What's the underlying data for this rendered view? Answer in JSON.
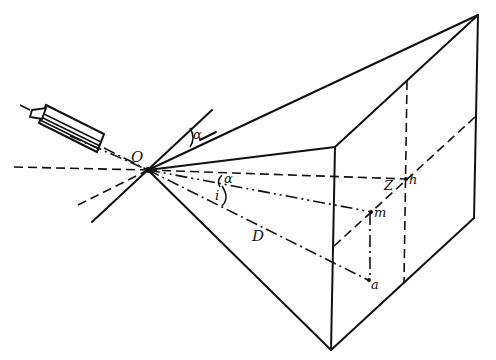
{
  "diagram": {
    "type": "geometric-optics-perspective",
    "colors": {
      "ink": "#111111",
      "background": "#ffffff"
    },
    "labels": {
      "origin": "O",
      "angle_upper": "α",
      "angle_lower": "α",
      "angle_i": "i",
      "distance": "D",
      "point_h": "h",
      "point_m": "m",
      "point_a": "a",
      "marker_z": "Z"
    },
    "elements": [
      "light-source-cylinder",
      "reflecting-plane-lines",
      "pyramid-to-rectangular-screen",
      "horizontal-reference-line",
      "projection-lines"
    ]
  }
}
